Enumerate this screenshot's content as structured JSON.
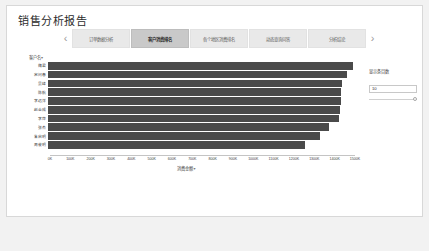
{
  "app": {
    "title": "销售分析报告",
    "background": "#f2f2f2",
    "panel_bg": "#ffffff"
  },
  "tabbar": {
    "prev_icon": "chevron-left-icon",
    "next_icon": "chevron-right-icon",
    "prev_glyph": "‹",
    "next_glyph": "›",
    "active_index": 1,
    "tabs": [
      {
        "label": "订单数据分析"
      },
      {
        "label": "客户消费排名"
      },
      {
        "label": "各个地区消费排名"
      },
      {
        "label": "动态查询问答"
      },
      {
        "label": "分析结论"
      }
    ]
  },
  "control": {
    "label": "显示条目数",
    "value": "10",
    "placeholder": "10",
    "slider_position_pct": 100
  },
  "chart_data": {
    "type": "bar",
    "orientation": "horizontal",
    "title": "",
    "xlabel": "消费金额",
    "ylabel": "客户名",
    "ylabel_caret": "▾",
    "xlabel_caret": "▾",
    "grid": false,
    "legend": false,
    "xlim": [
      0,
      1500
    ],
    "xunit": "K",
    "xticks": [
      "0K",
      "100K",
      "200K",
      "300K",
      "400K",
      "500K",
      "600K",
      "700K",
      "800K",
      "900K",
      "1000K",
      "1100K",
      "1200K",
      "1300K",
      "1400K",
      "1500K"
    ],
    "xtick_values": [
      0,
      100,
      200,
      300,
      400,
      500,
      600,
      700,
      800,
      900,
      1000,
      1100,
      1200,
      1300,
      1400,
      1500
    ],
    "bar_color": "#4a4a4a",
    "categories": [
      "魏君",
      "宋问春",
      "吴峰",
      "陈航",
      "李远洋",
      "赵金成",
      "李萍",
      "张杰",
      "朱启明",
      "周俊明"
    ],
    "values": [
      1490,
      1462,
      1436,
      1433,
      1430,
      1428,
      1424,
      1372,
      1330,
      1258
    ]
  }
}
